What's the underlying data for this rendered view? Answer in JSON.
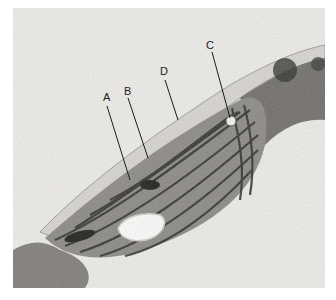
{
  "figure": {
    "labels": [
      {
        "id": "A",
        "text": "A",
        "x": 103,
        "y": 92
      },
      {
        "id": "B",
        "text": "B",
        "x": 124,
        "y": 86
      },
      {
        "id": "C",
        "text": "C",
        "x": 206,
        "y": 40
      },
      {
        "id": "D",
        "text": "D",
        "x": 160,
        "y": 66
      }
    ],
    "colors": {
      "background": "#ecebe8",
      "stroma": "#8a8884",
      "grana": "#2e2d2b",
      "envelope": "#c9c7c2",
      "starch": "#fbfbfa"
    }
  }
}
